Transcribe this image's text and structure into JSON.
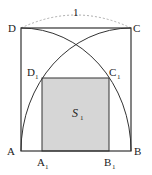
{
  "figure": {
    "title_label": "1",
    "vertices": {
      "A": "A",
      "B": "B",
      "C": "C",
      "D": "D"
    },
    "inner_vertices": {
      "A1": {
        "base": "A",
        "sub": "1"
      },
      "B1": {
        "base": "B",
        "sub": "1"
      },
      "C1": {
        "base": "C",
        "sub": "1"
      },
      "D1": {
        "base": "D",
        "sub": "1"
      }
    },
    "region_label": {
      "base": "S",
      "sub": "1"
    },
    "colors": {
      "stroke": "#333333",
      "fill": "#d6d6d6",
      "dashed": "#888888"
    }
  }
}
